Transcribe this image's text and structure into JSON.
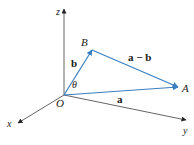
{
  "diagram": {
    "axes": {
      "x_label": "x",
      "y_label": "y",
      "z_label": "z"
    },
    "points": {
      "origin": "O",
      "A": "A",
      "B": "B"
    },
    "vectors": {
      "a": "a",
      "b": "b",
      "a_minus_b": "a − b"
    },
    "angle": "θ",
    "colors": {
      "vector": "#3a7fc1",
      "axis": "#555555",
      "text": "#1a1a1a"
    }
  }
}
